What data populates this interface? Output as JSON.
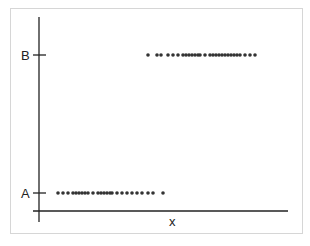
{
  "chart_data": {
    "type": "scatter",
    "title": "",
    "xlabel": "x",
    "ylabel": "",
    "y_categories": [
      "A",
      "B"
    ],
    "grid": false,
    "legend": null,
    "series": [
      {
        "name": "B",
        "y": "B",
        "x": [
          148,
          157,
          161,
          168,
          173,
          178,
          183,
          186,
          189,
          192,
          195,
          198,
          200,
          205,
          210,
          213,
          216,
          219,
          222,
          225,
          228,
          231,
          234,
          237,
          240,
          245,
          250,
          255
        ]
      },
      {
        "name": "A",
        "y": "A",
        "x": [
          58,
          63,
          68,
          73,
          76,
          79,
          82,
          85,
          88,
          93,
          98,
          101,
          104,
          107,
          110,
          112,
          117,
          122,
          127,
          132,
          137,
          142,
          148,
          153,
          163
        ]
      }
    ]
  },
  "axes": {
    "x_label": "x",
    "y_tick_labels": [
      "B",
      "A"
    ]
  },
  "colors": {
    "axis": "#222222",
    "points": "#333333",
    "frame": "#d6d6d6"
  }
}
